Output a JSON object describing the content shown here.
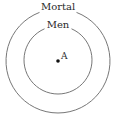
{
  "diagram": {
    "title": "",
    "outer_circle": {
      "label": "Mortal",
      "cx": 58,
      "cy": 61,
      "r": 52
    },
    "inner_circle": {
      "label": "Men",
      "cx": 58,
      "cy": 60,
      "r": 34
    },
    "point": {
      "label": "A",
      "cx": 58,
      "cy": 61
    },
    "colors": {
      "stroke": "#777777",
      "text": "#2a2a2a",
      "point": "#111111"
    }
  }
}
